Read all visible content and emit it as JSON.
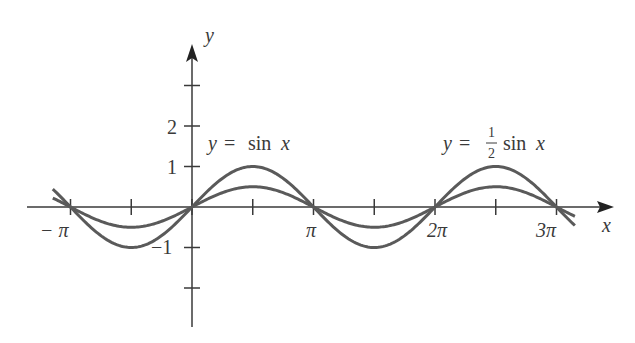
{
  "chart_data": {
    "type": "line",
    "title": "",
    "xlabel": "x",
    "ylabel": "y",
    "xlim": [
      -3.6,
      10.2
    ],
    "ylim": [
      -2.9,
      4.0
    ],
    "grid": false,
    "x_ticks": [
      {
        "value": -3.14159,
        "label": "−π"
      },
      {
        "value": -1.5708,
        "label": ""
      },
      {
        "value": 0,
        "label": ""
      },
      {
        "value": 1.5708,
        "label": ""
      },
      {
        "value": 3.14159,
        "label": "π"
      },
      {
        "value": 4.7124,
        "label": ""
      },
      {
        "value": 6.28319,
        "label": "2π"
      },
      {
        "value": 7.854,
        "label": ""
      },
      {
        "value": 9.42478,
        "label": "3π"
      }
    ],
    "y_ticks": [
      {
        "value": 3,
        "label": ""
      },
      {
        "value": 2,
        "label": "2"
      },
      {
        "value": 1,
        "label": "1"
      },
      {
        "value": -1,
        "label": "−1"
      },
      {
        "value": -2,
        "label": ""
      }
    ],
    "series": [
      {
        "name": "y = sin x",
        "function": "sin(x)",
        "amplitude": 1,
        "x_range": [
          -3.6,
          9.9
        ]
      },
      {
        "name": "y = (1/2) sin x",
        "function": "0.5*sin(x)",
        "amplitude": 0.5,
        "x_range": [
          -3.6,
          9.9
        ]
      }
    ],
    "annotations": [
      {
        "text": "y = sin x",
        "near_x": 1.2,
        "near_y": 1.7
      },
      {
        "text": "y = 1/2 sin x",
        "near_x": 7.6,
        "near_y": 1.7
      }
    ],
    "color": "#5a5a5a"
  },
  "labels": {
    "x_axis": "x",
    "y_axis": "y",
    "neg_pi": "− π",
    "pi": "π",
    "two_pi": "2π",
    "three_pi": "3π",
    "y_two": "2",
    "y_one": "1",
    "y_neg_one": "−1",
    "ann_sin_y": "y",
    "ann_sin_eq": "=",
    "ann_sin_rest": "sin",
    "ann_sin_x": "x",
    "ann_half_y": "y",
    "ann_half_eq": "=",
    "ann_half_num": "1",
    "ann_half_den": "2",
    "ann_half_rest": "sin",
    "ann_half_x": "x"
  }
}
